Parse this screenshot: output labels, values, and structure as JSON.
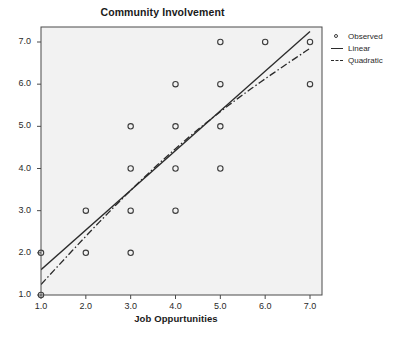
{
  "chart_data": {
    "type": "scatter",
    "title": "Community Involvement",
    "xlabel": "Job Oppurtunities",
    "ylabel": "",
    "xlim": [
      1.0,
      7.0
    ],
    "ylim": [
      1.0,
      7.0
    ],
    "xticks": [
      "1.0",
      "2.0",
      "3.0",
      "4.0",
      "5.0",
      "6.0",
      "7.0"
    ],
    "xtick_values": [
      1,
      2,
      3,
      4,
      5,
      6,
      7
    ],
    "yticks": [
      "1.0",
      "2.0",
      "3.0",
      "4.0",
      "5.0",
      "6.0",
      "7.0"
    ],
    "ytick_values": [
      1,
      2,
      3,
      4,
      5,
      6,
      7
    ],
    "grid": false,
    "legend_position": "right",
    "legend": [
      {
        "label": "Observed",
        "marker": "circle-open",
        "color": "#3c3c3c"
      },
      {
        "label": "Linear",
        "marker": "line-solid",
        "color": "#2b2b2b"
      },
      {
        "label": "Quadratic",
        "marker": "line-dashdot",
        "color": "#2b2b2b"
      }
    ],
    "series": [
      {
        "name": "Observed",
        "type": "scatter",
        "points": [
          {
            "x": 1,
            "y": 1
          },
          {
            "x": 1,
            "y": 2
          },
          {
            "x": 2,
            "y": 2
          },
          {
            "x": 3,
            "y": 2
          },
          {
            "x": 2,
            "y": 3
          },
          {
            "x": 3,
            "y": 3
          },
          {
            "x": 4,
            "y": 3
          },
          {
            "x": 3,
            "y": 4
          },
          {
            "x": 4,
            "y": 4
          },
          {
            "x": 5,
            "y": 4
          },
          {
            "x": 3,
            "y": 5
          },
          {
            "x": 4,
            "y": 5
          },
          {
            "x": 5,
            "y": 5
          },
          {
            "x": 4,
            "y": 6
          },
          {
            "x": 5,
            "y": 6
          },
          {
            "x": 7,
            "y": 6
          },
          {
            "x": 5,
            "y": 7
          },
          {
            "x": 6,
            "y": 7
          },
          {
            "x": 7,
            "y": 7
          }
        ]
      },
      {
        "name": "Linear",
        "type": "line",
        "style": "solid",
        "fit": {
          "intercept": 0.67,
          "slope": 0.93
        },
        "endpoints": [
          {
            "x": 1.0,
            "y": 1.6
          },
          {
            "x": 7.0,
            "y": 7.25
          }
        ]
      },
      {
        "name": "Quadratic",
        "type": "line",
        "style": "dash-dot",
        "fit": {
          "c0": 0.0,
          "c1": 1.35,
          "c2": -0.055
        },
        "endpoints": [
          {
            "x": 1.0,
            "y": 1.25
          },
          {
            "x": 7.0,
            "y": 6.85
          }
        ]
      }
    ]
  },
  "colors": {
    "plot_background": "#f2f2f2",
    "axis": "#4a4a4a",
    "marker": "#3c3c3c",
    "line": "#2b2b2b",
    "text": "#1a1a1a",
    "page_background": "#ffffff"
  }
}
